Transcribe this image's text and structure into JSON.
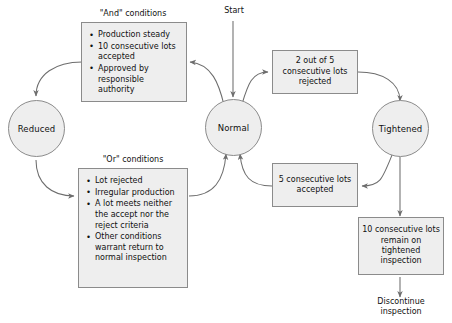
{
  "diagram": {
    "title_start_label": "Start",
    "states": [
      {
        "id": "reduced",
        "label": "Reduced"
      },
      {
        "id": "normal",
        "label": "Normal"
      },
      {
        "id": "tightened",
        "label": "Tightened"
      }
    ],
    "captions": [
      {
        "id": "and-caption",
        "text": "\"And\" conditions"
      },
      {
        "id": "or-caption",
        "text": "\"Or\" conditions"
      }
    ],
    "and_conditions": [
      "Production steady",
      "10 consecutive lots accepted",
      "Approved by responsible authority"
    ],
    "or_conditions": [
      "Lot rejected",
      "Irregular production",
      "A lot meets neither the accept nor the reject criteria",
      "Other conditions warrant return to normal inspection"
    ],
    "boxes": [
      {
        "id": "two-of-five",
        "text": "2 out of 5 consecutive lots rejected"
      },
      {
        "id": "five-accepted",
        "text": "5 consecutive lots accepted"
      },
      {
        "id": "ten-remain",
        "text": "10 consecutive lots remain on tightened inspection"
      }
    ],
    "terminal": {
      "id": "discontinue",
      "text": "Discontinue inspection"
    },
    "colors": {
      "node_fill": "#eeeeee",
      "node_border": "#8b8b8b",
      "edge": "#6d6d6d",
      "text": "#111111",
      "background": "#ffffff"
    }
  }
}
